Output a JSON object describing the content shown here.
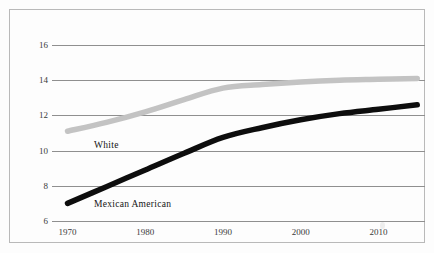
{
  "chart_data": {
    "type": "line",
    "title": "",
    "subtitle": "",
    "xlabel": "",
    "ylabel": "",
    "xlim": [
      1968,
      2016
    ],
    "ylim": [
      6,
      16
    ],
    "grid": true,
    "legend_position": "inline-labels",
    "x_ticks": [
      "1970",
      "1980",
      "1990",
      "2000",
      "2010"
    ],
    "x_tick_values": [
      1970,
      1980,
      1990,
      2000,
      2010
    ],
    "y_ticks": [
      "6",
      "8",
      "10",
      "12",
      "14",
      "16"
    ],
    "y_tick_values": [
      6,
      8,
      10,
      12,
      14,
      16
    ],
    "series": [
      {
        "name": "White",
        "color": "#c3c3c3",
        "label_x": 1973.4,
        "label_y": 10.25,
        "x": [
          1970,
          1975,
          1980,
          1985,
          1990,
          1995,
          2000,
          2005,
          2010,
          2015
        ],
        "values": [
          11.1,
          11.6,
          12.2,
          12.9,
          13.55,
          13.75,
          13.9,
          14.0,
          14.05,
          14.1
        ]
      },
      {
        "name": "Mexican American",
        "color": "#0d0d0d",
        "label_x": 1973.4,
        "label_y": 6.9,
        "x": [
          1970,
          1975,
          1980,
          1985,
          1990,
          1995,
          2000,
          2005,
          2010,
          2015
        ],
        "values": [
          7.0,
          7.95,
          8.9,
          9.85,
          10.75,
          11.3,
          11.75,
          12.1,
          12.35,
          12.6
        ]
      }
    ]
  },
  "figure": {
    "background_color": "#fdfdfd",
    "border_color": "#b9b9b9",
    "gridline_color": "#8f8f8f",
    "tick_text_color": "#3a3a3a"
  }
}
